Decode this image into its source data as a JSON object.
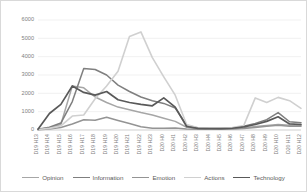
{
  "chart_data": {
    "type": "line",
    "title": "",
    "xlabel": "",
    "ylabel": "",
    "ylim": [
      0,
      6000
    ],
    "ytick_values": [
      0,
      1000,
      2000,
      3000,
      4000,
      5000,
      6000
    ],
    "ytick_labels": [
      "0",
      "1000",
      "2000",
      "3000",
      "4000",
      "5000",
      "6000"
    ],
    "grid": true,
    "legend_position": "bottom",
    "categories": [
      "D19 H13",
      "D19 H14",
      "D19 H15",
      "D19 H16",
      "D19 H17",
      "D19 H18",
      "D19 H19",
      "D19 H20",
      "D19 H21",
      "D19 H22",
      "D19 H23",
      "D20 H0",
      "D20 H1",
      "D20 H2",
      "D20 H3",
      "D20 H4",
      "D20 H5",
      "D20 H6",
      "D20 H7",
      "D20 H8",
      "D20 H9",
      "D20 H10",
      "D20 H11",
      "D20 H12"
    ],
    "series": [
      {
        "name": "Opinion",
        "color": "#a6a6a6",
        "width": 1.5,
        "values": [
          30,
          120,
          300,
          2400,
          2300,
          1800,
          1500,
          1250,
          1100,
          950,
          820,
          640,
          470,
          150,
          70,
          60,
          60,
          70,
          110,
          190,
          240,
          300,
          260,
          250
        ]
      },
      {
        "name": "Information",
        "color": "#7f7f7f",
        "width": 1.5,
        "values": [
          40,
          150,
          380,
          1550,
          3350,
          3300,
          3000,
          2450,
          2100,
          1800,
          1600,
          1450,
          1200,
          260,
          110,
          80,
          80,
          110,
          200,
          360,
          560,
          950,
          450,
          400
        ]
      },
      {
        "name": "Emotion",
        "color": "#949494",
        "width": 1.5,
        "values": [
          20,
          60,
          140,
          330,
          560,
          530,
          700,
          520,
          350,
          180,
          90,
          90,
          110,
          60,
          40,
          35,
          35,
          50,
          80,
          140,
          200,
          260,
          210,
          200
        ]
      },
      {
        "name": "Actions",
        "color": "#d0d0d0",
        "width": 1.6,
        "values": [
          25,
          90,
          220,
          760,
          820,
          1700,
          2400,
          3200,
          5100,
          5350,
          3950,
          2900,
          1900,
          300,
          120,
          90,
          95,
          130,
          250,
          1750,
          1500,
          1780,
          1600,
          1180
        ]
      },
      {
        "name": "Technology",
        "color": "#595959",
        "width": 1.7,
        "values": [
          35,
          900,
          1400,
          2400,
          2050,
          1900,
          2100,
          1650,
          1500,
          1400,
          1320,
          1750,
          1250,
          190,
          90,
          70,
          70,
          95,
          170,
          300,
          470,
          720,
          330,
          300
        ]
      }
    ]
  },
  "legend": {
    "items": [
      {
        "label": "Opinion"
      },
      {
        "label": "Information"
      },
      {
        "label": "Emotion"
      },
      {
        "label": "Actions"
      },
      {
        "label": "Technology"
      }
    ]
  }
}
